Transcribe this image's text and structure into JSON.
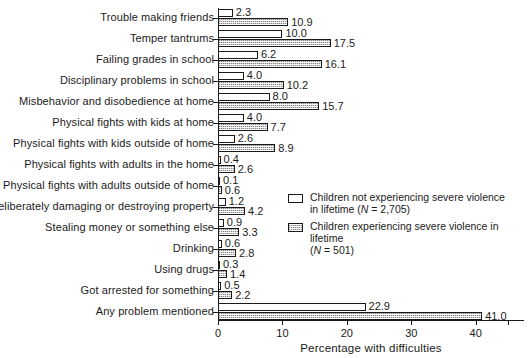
{
  "chart_data": {
    "type": "bar",
    "orientation": "horizontal",
    "title": "",
    "xlabel": "Percentage with difficulties",
    "ylabel": "",
    "xlim": [
      0,
      47.5
    ],
    "xticks": [
      0,
      10,
      20,
      30,
      40
    ],
    "xtick_labels": [
      "0",
      "10",
      "20",
      "30",
      "40"
    ],
    "grid": false,
    "legend_position": "center-right",
    "categories": [
      "Trouble making friends",
      "Temper tantrums",
      "Failing grades in school",
      "Disciplinary problems in school",
      "Misbehavior and disobedience at home",
      "Physical fights with kids at home",
      "Physical fights with kids outside of home",
      "Physical fights with adults in the home",
      "Physical fights with adults outside of home",
      "Deliberately damaging or destroying property",
      "Stealing money or something else",
      "Drinking",
      "Using drugs",
      "Got arrested for something",
      "Any problem mentioned"
    ],
    "series": [
      {
        "name": "Children not experiencing severe violence in lifetime (N = 2,705)",
        "key": "series-a",
        "values": [
          2.3,
          10.0,
          6.2,
          4.0,
          8.0,
          4.0,
          2.6,
          0.4,
          0.1,
          1.2,
          0.9,
          0.6,
          0.3,
          0.5,
          22.9
        ],
        "labels": [
          "2.3",
          "10.0",
          "6.2",
          "4.0",
          "8.0",
          "4.0",
          "2.6",
          "0.4",
          "0.1",
          "1.2",
          "0.9",
          "0.6",
          "0.3",
          "0.5",
          "22.9"
        ]
      },
      {
        "name": "Children experiencing severe violence in lifetime (N = 501)",
        "key": "series-b",
        "values": [
          10.9,
          17.5,
          16.1,
          10.2,
          15.7,
          7.7,
          8.9,
          2.6,
          0.6,
          4.2,
          3.3,
          2.8,
          1.4,
          2.2,
          41.0
        ],
        "labels": [
          "10.9",
          "17.5",
          "16.1",
          "10.2",
          "15.7",
          "7.7",
          "8.9",
          "2.6",
          "0.6",
          "4.2",
          "3.3",
          "2.8",
          "1.4",
          "2.2",
          "41.0"
        ]
      }
    ]
  },
  "legend": {
    "entries": [
      {
        "swatch": "series-a",
        "line1": "Children not experiencing severe violence",
        "line2_prefix": "in lifetime (",
        "line2_italic": "N",
        "line2_suffix": " = 2,705)"
      },
      {
        "swatch": "series-b",
        "line1": "Children experiencing severe violence in lifetime",
        "line2_prefix": "(",
        "line2_italic": "N",
        "line2_suffix": " = 501)"
      }
    ]
  }
}
